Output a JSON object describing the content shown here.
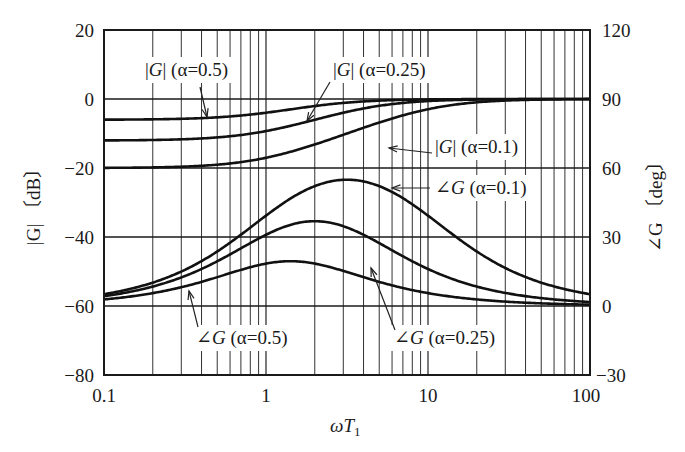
{
  "chart_data": {
    "type": "line",
    "title": "",
    "xlabel": "ωT₁",
    "ylabel_left": "|G| [dB]",
    "ylabel_right": "∠G [deg]",
    "xscale": "log",
    "xlim": [
      0.1,
      100
    ],
    "ylim_left": [
      -80,
      20
    ],
    "ylim_right": [
      -30,
      120
    ],
    "x_ticks": [
      "0.1",
      "1",
      "10",
      "100"
    ],
    "y_ticks_left": [
      "20",
      "0",
      "−20",
      "−40",
      "−60",
      "−80"
    ],
    "y_ticks_right": [
      "120",
      "90",
      "60",
      "30",
      "0",
      "−30"
    ],
    "grid": true,
    "model": "G(jωT₁) = α(1 + jωT₁)/(1 + jαωT₁)",
    "x": [
      0.1,
      0.2,
      0.3,
      0.5,
      1,
      1.41,
      2,
      3.16,
      5,
      10,
      20,
      50,
      100
    ],
    "series": [
      {
        "name": "|G| (α=0.5)",
        "axis": "left",
        "alpha": 0.5,
        "kind": "mag",
        "values": [
          -6.0,
          -5.9,
          -5.8,
          -5.4,
          -4.0,
          -3.0,
          -2.0,
          -1.0,
          -0.5,
          -0.1,
          0.0,
          0.0,
          0.0
        ]
      },
      {
        "name": "|G| (α=0.25)",
        "axis": "left",
        "alpha": 0.25,
        "kind": "mag",
        "values": [
          -12.0,
          -11.9,
          -11.7,
          -11.1,
          -9.0,
          -7.5,
          -6.0,
          -4.0,
          -2.5,
          -0.9,
          -0.3,
          0.0,
          0.0
        ]
      },
      {
        "name": "|G| (α=0.1)",
        "axis": "left",
        "alpha": 0.1,
        "kind": "mag",
        "values": [
          -20.0,
          -19.8,
          -19.6,
          -19.0,
          -17.0,
          -15.4,
          -13.3,
          -10.0,
          -7.0,
          -3.0,
          -1.0,
          -0.2,
          0.0
        ]
      },
      {
        "name": "∠G (α=0.5)",
        "axis": "right",
        "alpha": 0.5,
        "kind": "phase",
        "values": [
          2.8,
          5.6,
          8.1,
          12.0,
          18.4,
          19.5,
          18.4,
          14.5,
          10.0,
          5.4,
          2.8,
          1.1,
          0.6
        ]
      },
      {
        "name": "∠G (α=0.25)",
        "axis": "right",
        "alpha": 0.25,
        "kind": "phase",
        "values": [
          4.3,
          8.4,
          12.1,
          18.4,
          30.9,
          35.0,
          36.9,
          34.7,
          29.1,
          17.4,
          9.2,
          3.8,
          1.9
        ]
      },
      {
        "name": "∠G (α=0.1)",
        "axis": "right",
        "alpha": 0.1,
        "kind": "phase",
        "values": [
          5.1,
          10.2,
          15.0,
          23.7,
          39.3,
          47.4,
          53.6,
          54.9,
          52.1,
          39.3,
          24.4,
          10.2,
          5.1
        ]
      }
    ],
    "annotations": [
      {
        "text_pre": "|",
        "text_var": "G",
        "text_post": "| (α=0.5)"
      },
      {
        "text_pre": "|",
        "text_var": "G",
        "text_post": "| (α=0.25)"
      },
      {
        "text_pre": "|",
        "text_var": "G",
        "text_post": "| (α=0.1)"
      },
      {
        "text_pre": "∠",
        "text_var": "G",
        "text_post": " (α=0.1)"
      },
      {
        "text_pre": "∠",
        "text_var": "G",
        "text_post": " (α=0.5)"
      },
      {
        "text_pre": "∠",
        "text_var": "G",
        "text_post": " (α=0.25)"
      }
    ]
  },
  "labels": {
    "x_axis_var": "ω",
    "x_axis_T": "T",
    "x_axis_sub": "1",
    "left_axis_text": "|G| 〔dB〕",
    "right_axis_text": "∠G 〔deg〕"
  }
}
